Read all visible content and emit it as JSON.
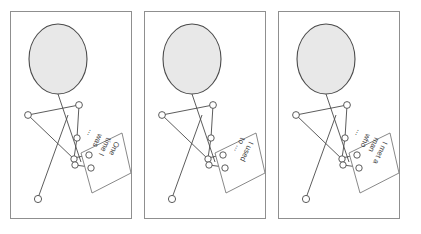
{
  "figure": {
    "caption": "",
    "panel_count": 3,
    "colors": {
      "panel_border": "#8f8f8f",
      "stroke": "#4a4a4a",
      "head_fill": "#e8e8e8",
      "head_stroke": "#4a4a4a",
      "node_fill": "#ffffff",
      "node_stroke": "#4a4a4a",
      "card_fill": "#ffffff",
      "card_stroke": "#7a7a7a",
      "text": "#3d3d3d",
      "background": "#ffffff"
    }
  },
  "panels": [
    {
      "id": "panel-1",
      "index": 1,
      "name": "panel-one-time-i-was",
      "card": {
        "name": "story-card",
        "lines": [
          "One",
          "time I",
          "was",
          "..."
        ],
        "text": "One time I was ..."
      },
      "figure_parts": {
        "head": "head-ellipse",
        "neck": "neck-line",
        "shoulder_left": "shoulder-left-node",
        "shoulder_right": "shoulder-right-node",
        "elbow": "elbow-node",
        "hand_upper": "hand-upper-node",
        "hand_lower": "hand-lower-node",
        "wrist": "wrist-node",
        "hip": "hip-node",
        "foot": "foot-node"
      }
    },
    {
      "id": "panel-2",
      "index": 2,
      "name": "panel-i-used-to",
      "card": {
        "name": "story-card",
        "lines": [
          "I used",
          "to ..."
        ],
        "text": "I used to ..."
      },
      "figure_parts": {
        "head": "head-ellipse",
        "neck": "neck-line",
        "shoulder_left": "shoulder-left-node",
        "shoulder_right": "shoulder-right-node",
        "elbow": "elbow-node",
        "hand_upper": "hand-upper-node",
        "hand_lower": "hand-lower-node",
        "wrist": "wrist-node",
        "hip": "hip-node",
        "foot": "foot-node"
      }
    },
    {
      "id": "panel-3",
      "index": 3,
      "name": "panel-i-met-a-man-who",
      "card": {
        "name": "story-card",
        "lines": [
          "I met a",
          "man",
          "who",
          "..."
        ],
        "text": "I met a man who ..."
      },
      "figure_parts": {
        "head": "head-ellipse",
        "neck": "neck-line",
        "shoulder_left": "shoulder-left-node",
        "shoulder_right": "shoulder-right-node",
        "elbow": "elbow-node",
        "hand_upper": "hand-upper-node",
        "hand_lower": "hand-lower-node",
        "wrist": "wrist-node",
        "hip": "hip-node",
        "foot": "foot-node"
      }
    }
  ],
  "geometry": {
    "panel_width": 122,
    "panel_height": 208,
    "panel_gap": 12,
    "left_margin": 10,
    "top_margin": 11
  }
}
